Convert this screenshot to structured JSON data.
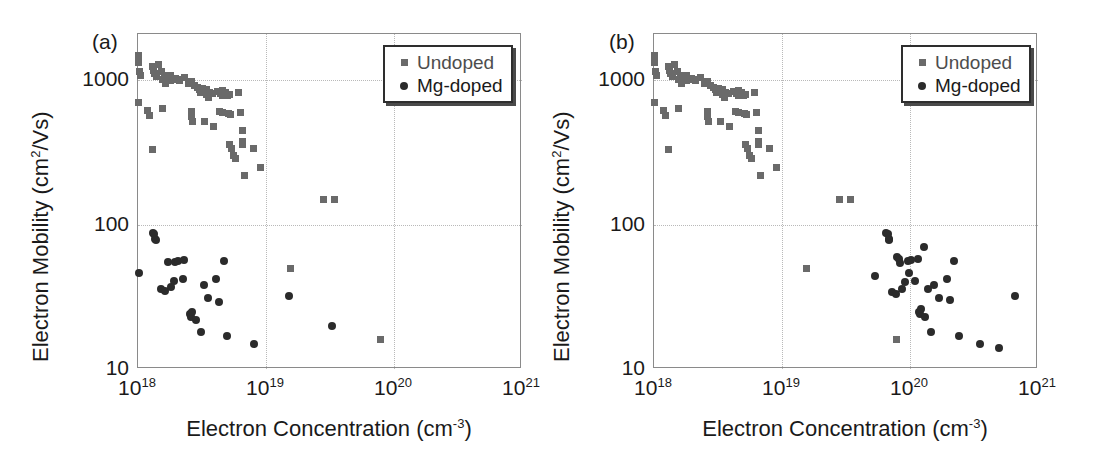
{
  "figure": {
    "background": "#ffffff",
    "undoped_color": "#6a6a6a",
    "mgdoped_color": "#2b2b2b",
    "axis_color": "#8a8a8a",
    "grid_color": "#b9b9b9"
  },
  "panels": [
    {
      "id": "a",
      "label": "(a)",
      "legend": {
        "entries": [
          {
            "marker": "square-marker",
            "label": "Undoped"
          },
          {
            "marker": "circle-marker",
            "label": "Mg-doped"
          }
        ]
      }
    },
    {
      "id": "b",
      "label": "(b)",
      "legend": {
        "entries": [
          {
            "marker": "square-marker",
            "label": "Undoped"
          },
          {
            "marker": "circle-marker",
            "label": "Mg-doped"
          }
        ]
      }
    }
  ],
  "axes": {
    "xlabel_main": "Electron Concentration (cm",
    "xlabel_sup": "-3",
    "xlabel_tail": ")",
    "ylabel_main": "Electron Mobility (cm",
    "ylabel_sup": "2",
    "ylabel_tail": "/Vs)",
    "xticks": [
      {
        "base": "10",
        "exp": "18",
        "value": 1e+18
      },
      {
        "base": "10",
        "exp": "19",
        "value": 1e+19
      },
      {
        "base": "10",
        "exp": "20",
        "value": 1e+20
      },
      {
        "base": "10",
        "exp": "21",
        "value": 1e+21
      }
    ],
    "yticks": [
      {
        "label": "1000",
        "value": 1000
      },
      {
        "label": "100",
        "value": 100
      },
      {
        "label": "10",
        "value": 10
      }
    ],
    "xlim": [
      1e+18,
      1e+21
    ],
    "ylim": [
      10,
      2100
    ],
    "xscale": "log",
    "yscale": "log",
    "grid": true
  },
  "chart_data": [
    {
      "type": "scatter",
      "panel": "a",
      "title": "(a)",
      "xlabel": "Electron Concentration (cm^-3)",
      "ylabel": "Electron Mobility (cm^2/Vs)",
      "xscale": "log",
      "yscale": "log",
      "xlim": [
        1e+18,
        1e+21
      ],
      "ylim": [
        10,
        2100
      ],
      "grid": true,
      "legend_position": "top-right",
      "series": [
        {
          "name": "Undoped",
          "marker": "square",
          "color": "#6a6a6a",
          "points": [
            [
              1e+18,
              1500
            ],
            [
              1e+18,
              1340
            ],
            [
              1.02e+18,
              1150
            ],
            [
              1.05e+18,
              1090
            ],
            [
              1e+18,
              700
            ],
            [
              1.18e+18,
              620
            ],
            [
              1.22e+18,
              575
            ],
            [
              1.3e+18,
              1250
            ],
            [
              1.32e+18,
              1180
            ],
            [
              1.35e+18,
              1120
            ],
            [
              1.4e+18,
              1060
            ],
            [
              1.45e+18,
              1300
            ],
            [
              1.52e+18,
              1150
            ],
            [
              1.55e+18,
              1020
            ],
            [
              1.6e+18,
              1090
            ],
            [
              1.65e+18,
              960
            ],
            [
              1.7e+18,
              1010
            ],
            [
              1.78e+18,
              1090
            ],
            [
              1.8e+18,
              1000
            ],
            [
              1.3e+18,
              330
            ],
            [
              1.55e+18,
              640
            ],
            [
              1.95e+18,
              1030
            ],
            [
              2.05e+18,
              1020
            ],
            [
              2.1e+18,
              1000
            ],
            [
              2.3e+18,
              1050
            ],
            [
              2.5e+18,
              960
            ],
            [
              2.6e+18,
              980
            ],
            [
              2.75e+18,
              930
            ],
            [
              2.6e+18,
              610
            ],
            [
              2.62e+18,
              560
            ],
            [
              2.65e+18,
              520
            ],
            [
              2.9e+18,
              900
            ],
            [
              3e+18,
              860
            ],
            [
              3.1e+18,
              820
            ],
            [
              3.2e+18,
              880
            ],
            [
              3.4e+18,
              870
            ],
            [
              3.45e+18,
              800
            ],
            [
              3.55e+18,
              760
            ],
            [
              3.6e+18,
              830
            ],
            [
              3.8e+18,
              810
            ],
            [
              3.3e+18,
              520
            ],
            [
              3.9e+18,
              480
            ],
            [
              4.2e+18,
              840
            ],
            [
              4.4e+18,
              810
            ],
            [
              4.55e+18,
              790
            ],
            [
              4.6e+18,
              850
            ],
            [
              4.8e+18,
              820
            ],
            [
              4.3e+18,
              610
            ],
            [
              4.55e+18,
              600
            ],
            [
              5e+18,
              790
            ],
            [
              5.2e+18,
              800
            ],
            [
              5.1e+18,
              590
            ],
            [
              5.3e+18,
              580
            ],
            [
              5.2e+18,
              360
            ],
            [
              5.35e+18,
              340
            ],
            [
              5.6e+18,
              300
            ],
            [
              5.8e+18,
              290
            ],
            [
              6.1e+18,
              820
            ],
            [
              6.3e+18,
              600
            ],
            [
              6.5e+18,
              450
            ],
            [
              6.55e+18,
              380
            ],
            [
              6.6e+18,
              360
            ],
            [
              6.8e+18,
              220
            ],
            [
              8e+18,
              340
            ],
            [
              9e+18,
              250
            ],
            [
              2.8e+19,
              150
            ],
            [
              3.4e+19,
              150
            ],
            [
              1.55e+19,
              50
            ],
            [
              7.8e+19,
              16
            ]
          ]
        },
        {
          "name": "Mg-doped",
          "marker": "circle",
          "color": "#2b2b2b",
          "points": [
            [
              1.3e+18,
              88
            ],
            [
              1.33e+18,
              86
            ],
            [
              1.35e+18,
              80
            ],
            [
              1.38e+18,
              78
            ],
            [
              1.02e+18,
              46
            ],
            [
              1.5e+18,
              36
            ],
            [
              1.62e+18,
              35
            ],
            [
              1.72e+18,
              55
            ],
            [
              1.95e+18,
              55
            ],
            [
              2.05e+18,
              56
            ],
            [
              2.3e+18,
              57
            ],
            [
              1.9e+18,
              41
            ],
            [
              2.25e+18,
              42
            ],
            [
              1.8e+18,
              37
            ],
            [
              2.55e+18,
              24
            ],
            [
              2.58e+18,
              23
            ],
            [
              2.62e+18,
              25
            ],
            [
              2.85e+18,
              22
            ],
            [
              3.1e+18,
              18
            ],
            [
              3.3e+18,
              38
            ],
            [
              3.55e+18,
              31
            ],
            [
              4.1e+18,
              42
            ],
            [
              4.3e+18,
              29
            ],
            [
              4.7e+18,
              56
            ],
            [
              5e+18,
              17
            ],
            [
              8e+18,
              15
            ],
            [
              1.5e+19,
              32
            ],
            [
              3.3e+19,
              20
            ]
          ]
        }
      ]
    },
    {
      "type": "scatter",
      "panel": "b",
      "title": "(b)",
      "xlabel": "Electron Concentration (cm^-3)",
      "ylabel": "Electron Mobility (cm^2/Vs)",
      "xscale": "log",
      "yscale": "log",
      "xlim": [
        1e+18,
        1e+21
      ],
      "ylim": [
        10,
        2100
      ],
      "grid": true,
      "legend_position": "top-right",
      "series": [
        {
          "name": "Undoped",
          "marker": "square",
          "color": "#6a6a6a",
          "points": [
            [
              1e+18,
              1500
            ],
            [
              1e+18,
              1340
            ],
            [
              1.02e+18,
              1150
            ],
            [
              1.05e+18,
              1090
            ],
            [
              1e+18,
              700
            ],
            [
              1.18e+18,
              620
            ],
            [
              1.22e+18,
              575
            ],
            [
              1.3e+18,
              1250
            ],
            [
              1.32e+18,
              1180
            ],
            [
              1.35e+18,
              1120
            ],
            [
              1.4e+18,
              1060
            ],
            [
              1.45e+18,
              1300
            ],
            [
              1.52e+18,
              1150
            ],
            [
              1.55e+18,
              1020
            ],
            [
              1.6e+18,
              1090
            ],
            [
              1.65e+18,
              960
            ],
            [
              1.7e+18,
              1010
            ],
            [
              1.78e+18,
              1090
            ],
            [
              1.8e+18,
              1000
            ],
            [
              1.3e+18,
              330
            ],
            [
              1.55e+18,
              640
            ],
            [
              1.95e+18,
              1030
            ],
            [
              2.05e+18,
              1020
            ],
            [
              2.1e+18,
              1000
            ],
            [
              2.3e+18,
              1050
            ],
            [
              2.5e+18,
              960
            ],
            [
              2.6e+18,
              980
            ],
            [
              2.75e+18,
              930
            ],
            [
              2.6e+18,
              610
            ],
            [
              2.62e+18,
              560
            ],
            [
              2.65e+18,
              520
            ],
            [
              2.9e+18,
              900
            ],
            [
              3e+18,
              860
            ],
            [
              3.1e+18,
              820
            ],
            [
              3.2e+18,
              880
            ],
            [
              3.4e+18,
              870
            ],
            [
              3.45e+18,
              800
            ],
            [
              3.55e+18,
              760
            ],
            [
              3.6e+18,
              830
            ],
            [
              3.8e+18,
              810
            ],
            [
              3.3e+18,
              520
            ],
            [
              3.9e+18,
              480
            ],
            [
              4.2e+18,
              840
            ],
            [
              4.4e+18,
              810
            ],
            [
              4.55e+18,
              790
            ],
            [
              4.6e+18,
              850
            ],
            [
              4.8e+18,
              820
            ],
            [
              4.3e+18,
              610
            ],
            [
              4.55e+18,
              600
            ],
            [
              5e+18,
              790
            ],
            [
              5.2e+18,
              800
            ],
            [
              5.1e+18,
              590
            ],
            [
              5.3e+18,
              580
            ],
            [
              5.2e+18,
              360
            ],
            [
              5.35e+18,
              340
            ],
            [
              5.6e+18,
              300
            ],
            [
              5.8e+18,
              290
            ],
            [
              6.1e+18,
              820
            ],
            [
              6.3e+18,
              600
            ],
            [
              6.5e+18,
              450
            ],
            [
              6.55e+18,
              380
            ],
            [
              6.6e+18,
              360
            ],
            [
              6.8e+18,
              220
            ],
            [
              8e+18,
              340
            ],
            [
              9e+18,
              250
            ],
            [
              2.8e+19,
              150
            ],
            [
              3.4e+19,
              150
            ],
            [
              1.55e+19,
              50
            ],
            [
              7.8e+19,
              16
            ]
          ]
        },
        {
          "name": "Mg-doped",
          "marker": "circle",
          "color": "#2b2b2b",
          "points": [
            [
              6.5e+19,
              88
            ],
            [
              6.7e+19,
              86
            ],
            [
              6.8e+19,
              80
            ],
            [
              6.9e+19,
              78
            ],
            [
              5.3e+19,
              44
            ],
            [
              7.2e+19,
              34
            ],
            [
              7.8e+19,
              33
            ],
            [
              8.4e+19,
              54
            ],
            [
              9.6e+19,
              56
            ],
            [
              1.01e+20,
              57
            ],
            [
              1.15e+20,
              58
            ],
            [
              9.2e+19,
              40
            ],
            [
              1.1e+20,
              41
            ],
            [
              8.6e+19,
              36
            ],
            [
              1.18e+20,
              25
            ],
            [
              1.2e+20,
              24
            ],
            [
              1.22e+20,
              26
            ],
            [
              1.32e+20,
              23
            ],
            [
              1.45e+20,
              18
            ],
            [
              1.55e+20,
              38
            ],
            [
              1.7e+20,
              31
            ],
            [
              1.95e+20,
              42
            ],
            [
              2.05e+20,
              30
            ],
            [
              2.2e+20,
              56
            ],
            [
              2.4e+20,
              17
            ],
            [
              3.5e+20,
              15
            ],
            [
              6.6e+20,
              32
            ],
            [
              5e+20,
              14
            ],
            [
              7.9e+19,
              60
            ],
            [
              8.2e+19,
              58
            ],
            [
              1.28e+20,
              70
            ],
            [
              1.38e+20,
              36
            ],
            [
              9.8e+19,
              46
            ]
          ]
        }
      ]
    }
  ]
}
